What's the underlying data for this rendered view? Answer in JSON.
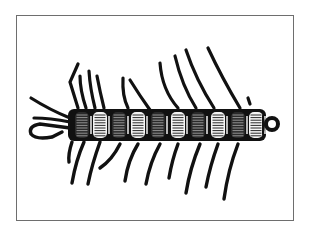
{
  "illustration": {
    "subject": "fishing fly illustration (segmented centipede-style body with hook and eye)",
    "style": "black ink engraving on white",
    "colors": {
      "ink": "#111111",
      "paper": "#ffffff",
      "frame": "#6e6e6e"
    },
    "body": {
      "x1": 68,
      "x2": 266,
      "cy": 125,
      "ry": 16
    },
    "segments_x": [
      82,
      100,
      119,
      138,
      158,
      178,
      198,
      218,
      238,
      256
    ],
    "legs_top": [
      "M78 108 L70 82 L78 64",
      "M86 108 Q80 90 80 76",
      "M95 108 Q90 88 89 71",
      "M104 108 Q100 92 97 76",
      "M128 108 Q122 96 123 78",
      "M150 110 Q140 96 130 80",
      "M178 108 Q162 90 160 63",
      "M196 108 Q182 86 175 56",
      "M214 108 Q196 80 186 50",
      "M240 108 Q222 78 208 48",
      "M250 104 L248 98"
    ],
    "legs_bottom": [
      "M72 142 Q68 154 69 162",
      "M84 142 Q76 160 72 183",
      "M100 142 Q92 164 88 184",
      "M120 144 Q112 160 100 168",
      "M138 144 Q128 160 125 181",
      "M160 144 Q150 162 146 184",
      "M178 144 Q172 160 169 178",
      "M200 144 Q190 168 186 193",
      "M218 144 Q210 166 206 187",
      "M238 144 Q228 170 224 199"
    ],
    "tail_fibers": [
      "M70 118 Q50 110 31 98",
      "M70 122 Q50 118 34 118"
    ],
    "hook": "M70 128 L40 124 Q28 126 31 134 Q36 140 52 137 L62 132",
    "eye": {
      "cx": 272,
      "cy": 124,
      "r": 6
    }
  }
}
